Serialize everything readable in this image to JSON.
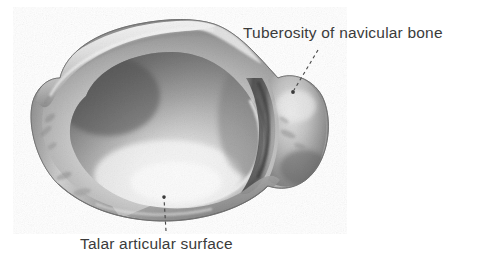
{
  "figure": {
    "type": "anatomical-illustration",
    "subject": "navicular bone",
    "view": "proximal (talar) articular view",
    "background_color": "#ffffff",
    "image_style": "grayscale halftone photographic plate",
    "bone_tones": {
      "deep_shadow": "#4a4a4a",
      "mid_shadow": "#8d8d8d",
      "mid_tone": "#b4b4b4",
      "rim_light": "#dcdcdc",
      "highlight": "#f2f2f2",
      "outline": "#6f6f6f"
    },
    "labels": [
      {
        "id": "tuberosity",
        "text": "Tuberosity of navicular bone",
        "position": "top-right",
        "color": "#3b3b3b",
        "leader": {
          "style": "dashed",
          "from_x": 318,
          "from_y": 50,
          "to_x": 293,
          "to_y": 92,
          "endpoint_marker": "dot"
        }
      },
      {
        "id": "talar",
        "text": "Talar articular surface",
        "position": "bottom-left",
        "color": "#3b3b3b",
        "leader": {
          "style": "dashed",
          "from_x": 166,
          "from_y": 231,
          "to_x": 164,
          "to_y": 196,
          "endpoint_marker": "dot"
        }
      }
    ],
    "features": [
      {
        "name": "talar-articular-surface",
        "description": "large concave oval articular cup occupying the main body of the bone, shadowed at its upper-left rim and brightly highlighted toward the lower-centre"
      },
      {
        "name": "navicular-tuberosity",
        "description": "rounded knob projecting on the right side, separated from the articular cup by a deep curved groove"
      },
      {
        "name": "superior-ridge",
        "description": "light raised rim running along the upper-left margin of the bone"
      }
    ]
  }
}
